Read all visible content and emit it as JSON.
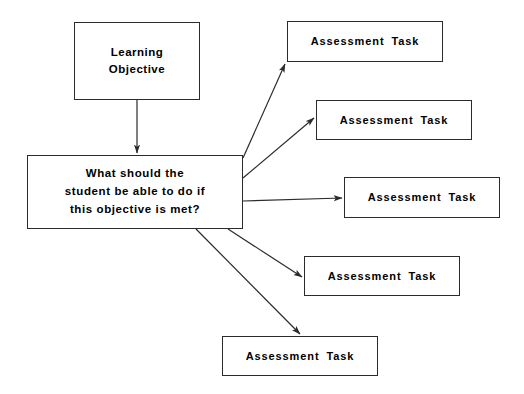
{
  "diagram": {
    "type": "flowchart",
    "background_color": "#ffffff",
    "line_color": "#2b2b2b",
    "text_color": "#000000",
    "width": 524,
    "height": 394,
    "nodes": [
      {
        "id": "learning-objective",
        "label": "Learning\nObjective",
        "shape": "rectangle",
        "x": 74,
        "y": 22,
        "width": 126,
        "height": 78
      },
      {
        "id": "guiding-question",
        "label": "What should the\nstudent be able to do if\nthis objective is met?",
        "shape": "rectangle",
        "x": 27,
        "y": 155,
        "width": 216,
        "height": 74
      },
      {
        "id": "assessment-task-1",
        "label": "Assessment Task",
        "shape": "rectangle",
        "x": 287,
        "y": 21,
        "width": 156,
        "height": 41
      },
      {
        "id": "assessment-task-2",
        "label": "Assessment Task",
        "shape": "rectangle",
        "x": 316,
        "y": 100,
        "width": 156,
        "height": 40
      },
      {
        "id": "assessment-task-3",
        "label": "Assessment Task",
        "shape": "rectangle",
        "x": 344,
        "y": 177,
        "width": 156,
        "height": 41
      },
      {
        "id": "assessment-task-4",
        "label": "Assessment Task",
        "shape": "rectangle",
        "x": 304,
        "y": 256,
        "width": 156,
        "height": 40
      },
      {
        "id": "assessment-task-5",
        "label": "Assessment Task",
        "shape": "rectangle",
        "x": 222,
        "y": 336,
        "width": 156,
        "height": 40
      }
    ],
    "edges": [
      {
        "id": "edge-objective-to-question",
        "from": "learning-objective",
        "to": "guiding-question",
        "style": "solid-arrow",
        "x1": 137,
        "y1": 100,
        "x2": 137,
        "y2": 153
      },
      {
        "id": "edge-question-to-task-1",
        "from": "guiding-question",
        "to": "assessment-task-1",
        "style": "solid-arrow",
        "x1": 243,
        "y1": 158,
        "x2": 285,
        "y2": 64
      },
      {
        "id": "edge-question-to-task-2",
        "from": "guiding-question",
        "to": "assessment-task-2",
        "style": "solid-arrow",
        "x1": 243,
        "y1": 178,
        "x2": 314,
        "y2": 118
      },
      {
        "id": "edge-question-to-task-3",
        "from": "guiding-question",
        "to": "assessment-task-3",
        "style": "solid-arrow",
        "x1": 243,
        "y1": 201,
        "x2": 342,
        "y2": 198
      },
      {
        "id": "edge-question-to-task-4",
        "from": "guiding-question",
        "to": "assessment-task-4",
        "style": "solid-arrow",
        "x1": 228,
        "y1": 229,
        "x2": 302,
        "y2": 277
      },
      {
        "id": "edge-question-to-task-5",
        "from": "guiding-question",
        "to": "assessment-task-5",
        "style": "solid-arrow",
        "x1": 196,
        "y1": 229,
        "x2": 300,
        "y2": 334
      }
    ]
  }
}
